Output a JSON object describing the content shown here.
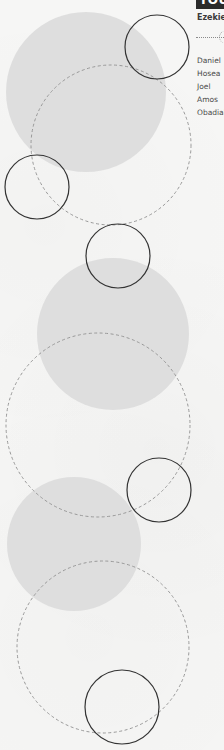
{
  "panel": {
    "title_bar_label": "YOUS",
    "header_label": "Ezekiel",
    "names": [
      {
        "label": "Daniel"
      },
      {
        "label": "Hosea"
      },
      {
        "label": "Joel"
      },
      {
        "label": "Amos"
      },
      {
        "label": "Obadiah"
      }
    ]
  },
  "colors": {
    "background": "#f6f6f5",
    "filled_circle": "#dcdcdc",
    "dashed_stroke": "#999999",
    "solid_stroke": "#333333",
    "title_bar": "#2b2b2b",
    "text": "#4a4a4a"
  },
  "shapes": {
    "filled_circles": [
      {
        "cx": 86,
        "cy": 92,
        "r": 80
      },
      {
        "cx": 113,
        "cy": 334,
        "r": 76
      },
      {
        "cx": 74,
        "cy": 544,
        "r": 67
      }
    ],
    "dashed_circles": [
      {
        "cx": 111,
        "cy": 145,
        "r": 80
      },
      {
        "cx": 98,
        "cy": 425,
        "r": 92
      },
      {
        "cx": 103,
        "cy": 647,
        "r": 86
      }
    ],
    "solid_circles": [
      {
        "cx": 157,
        "cy": 47,
        "r": 32
      },
      {
        "cx": 37,
        "cy": 187,
        "r": 32
      },
      {
        "cx": 118,
        "cy": 256,
        "r": 32
      },
      {
        "cx": 159,
        "cy": 490,
        "r": 32
      },
      {
        "cx": 122,
        "cy": 707,
        "r": 37
      }
    ]
  }
}
